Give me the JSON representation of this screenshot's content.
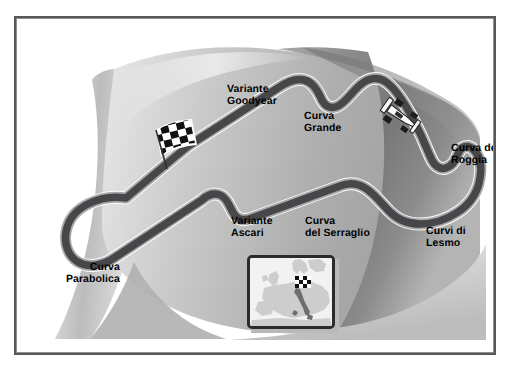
{
  "figure": {
    "background_color": "#ffffff",
    "frame_color": "#58585c"
  },
  "track": {
    "name": "Monza",
    "surface_color": "#4a4a4d",
    "edge_color": "#a3a3a6",
    "corner_labels": [
      {
        "id": "variante-goodyear",
        "line1": "Variante",
        "line2": "Goodyear",
        "text": "Variante\nGoodyear",
        "align": "left"
      },
      {
        "id": "curva-grande",
        "line1": "Curva",
        "line2": "Grande",
        "text": "Curva\nGrande",
        "align": "left"
      },
      {
        "id": "curva-del-roggia",
        "line1": "Curva del",
        "line2": "Roggia",
        "text": "Curva del\nRoggia",
        "align": "left"
      },
      {
        "id": "curvi-di-lesmo",
        "line1": "Curvi di",
        "line2": "Lesmo",
        "text": "Curvi di\nLesmo",
        "align": "left"
      },
      {
        "id": "curva-del-serraglio",
        "line1": "Curva",
        "line2": "del Serraglio",
        "text": "Curva\ndel Serraglio",
        "align": "left"
      },
      {
        "id": "variante-ascari",
        "line1": "Variante",
        "line2": "Ascari",
        "text": "Variante\nAscari",
        "align": "left"
      },
      {
        "id": "curva-parabolica",
        "line1": "Curva",
        "line2": "Parabolica",
        "text": "Curva\nParabolica",
        "align": "right"
      }
    ]
  },
  "markers": {
    "start_finish_flag": "checkered-flag-icon",
    "race_car": "formula-one-car-icon"
  },
  "inset": {
    "type": "locator-map",
    "region": "Europe",
    "highlighted_country": "Italy",
    "marker": "checkered-flag-icon",
    "land_color": "#cfcfcf",
    "sea_color": "#f2f2f2",
    "highlight_color": "#7a7a7a"
  }
}
